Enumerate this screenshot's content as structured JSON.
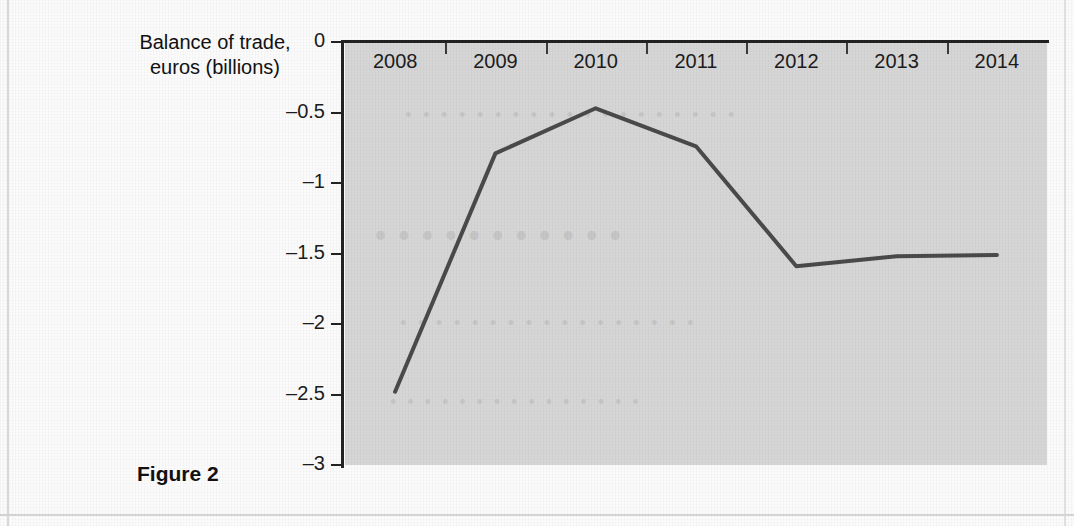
{
  "figure": {
    "caption": "Figure 2"
  },
  "chart_data": {
    "type": "line",
    "title": "",
    "ylabel_lines": [
      "Balance of trade,",
      "euros (billions)"
    ],
    "ylabel": "Balance of trade, euros (billions)",
    "xlabel": "",
    "categories": [
      "2008",
      "2009",
      "2010",
      "2011",
      "2012",
      "2013",
      "2014"
    ],
    "values": [
      -2.48,
      -0.79,
      -0.47,
      -0.74,
      -1.59,
      -1.52,
      -1.51
    ],
    "series": [
      {
        "name": "Balance of trade",
        "values": [
          -2.48,
          -0.79,
          -0.47,
          -0.74,
          -1.59,
          -1.52,
          -1.51
        ]
      }
    ],
    "ylim": [
      -3,
      0
    ],
    "xlim": [
      "2008",
      "2014"
    ],
    "ytick_labels": [
      "0",
      "–0.5",
      "–1",
      "–1.5",
      "–2",
      "–2.5",
      "–3"
    ],
    "ytick_values": [
      0,
      -0.5,
      -1,
      -1.5,
      -2,
      -2.5,
      -3
    ],
    "grid": false,
    "legend": "none",
    "line_color": "#4a4a4a",
    "plot_background": "#d6d6d6",
    "axis_color": "#222222"
  },
  "showthrough": {
    "line_1": "• • • • • • • • • • • • • • • • • • •",
    "line_2": "• • • • • • • • • • •",
    "line_3": "• • • • • • • • • • • • • • • • •",
    "line_4": "• • • • • • • • • • • • • • •"
  }
}
